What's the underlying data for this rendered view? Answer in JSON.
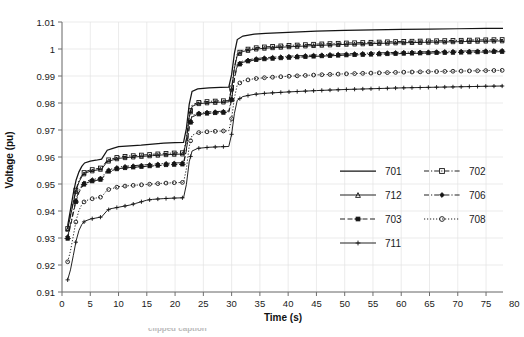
{
  "chart_data": {
    "type": "line",
    "title": "",
    "xlabel": "Time (s)",
    "ylabel": "Voltage (pu)",
    "xlim": [
      0,
      78
    ],
    "ylim": [
      0.91,
      1.01
    ],
    "grid": true,
    "legend_position": "center-right",
    "xticks": [
      0,
      5,
      10,
      15,
      20,
      25,
      30,
      35,
      40,
      45,
      50,
      55,
      60,
      65,
      70,
      75,
      80
    ],
    "yticks": [
      0.91,
      0.92,
      0.93,
      0.94,
      0.95,
      0.96,
      0.97,
      0.98,
      0.99,
      1.0,
      1.01
    ],
    "ytick_labels": [
      "0.91",
      "0.92",
      "0.93",
      "0.94",
      "0.95",
      "0.96",
      "0.97",
      "0.98",
      "0.99",
      "1",
      "1.01"
    ],
    "xtick_labels": [
      "0",
      "5",
      "10",
      "15",
      "20",
      "25",
      "30",
      "35",
      "40",
      "45",
      "50",
      "55",
      "60",
      "65",
      "70",
      "75",
      "80"
    ],
    "series": [
      {
        "name": "701",
        "style": "solid",
        "marker": "none",
        "x": [
          1,
          1.5,
          2,
          2.5,
          3,
          3.5,
          4,
          5,
          6,
          7,
          8,
          9,
          10,
          12,
          14,
          16,
          18,
          20,
          21.5,
          22,
          22.5,
          23,
          24,
          26,
          28,
          29.5,
          30,
          30.5,
          31,
          32,
          34,
          36,
          40,
          45,
          50,
          55,
          60,
          65,
          70,
          75,
          78
        ],
        "y": [
          0.9345,
          0.9405,
          0.9465,
          0.9515,
          0.9545,
          0.9565,
          0.9578,
          0.9585,
          0.9588,
          0.9592,
          0.9625,
          0.9632,
          0.9638,
          0.9641,
          0.9644,
          0.9648,
          0.9651,
          0.9653,
          0.9654,
          0.9705,
          0.9795,
          0.9843,
          0.9852,
          0.9856,
          0.9858,
          0.9859,
          0.9905,
          0.9985,
          1.0035,
          1.0048,
          1.0055,
          1.0058,
          1.0062,
          1.0066,
          1.0069,
          1.0071,
          1.0073,
          1.0074,
          1.0075,
          1.0076,
          1.0076
        ]
      },
      {
        "name": "702",
        "style": "dash-dot",
        "marker": "square",
        "x": [
          1,
          1.5,
          2,
          2.5,
          3,
          3.5,
          4,
          5,
          6,
          7,
          8,
          9,
          10,
          12,
          14,
          16,
          18,
          20,
          21.5,
          22,
          22.5,
          23,
          24,
          26,
          28,
          29.5,
          30,
          30.5,
          31,
          32,
          34,
          36,
          40,
          45,
          50,
          55,
          60,
          65,
          70,
          75,
          78
        ],
        "y": [
          0.9335,
          0.9385,
          0.9435,
          0.9482,
          0.9512,
          0.9532,
          0.9545,
          0.9552,
          0.9556,
          0.956,
          0.9588,
          0.9594,
          0.96,
          0.9604,
          0.9607,
          0.961,
          0.9613,
          0.9615,
          0.9616,
          0.9668,
          0.9752,
          0.9792,
          0.9802,
          0.9806,
          0.9808,
          0.9809,
          0.9856,
          0.9934,
          0.9982,
          0.9996,
          1.0004,
          1.0008,
          1.0013,
          1.0018,
          1.0022,
          1.0025,
          1.0028,
          1.003,
          1.0032,
          1.0034,
          1.0035
        ]
      },
      {
        "name": "712",
        "style": "solid-marker",
        "marker": "triangle",
        "x": [
          1,
          1.5,
          2,
          2.5,
          3,
          3.5,
          4,
          5,
          6,
          7,
          8,
          9,
          10,
          12,
          14,
          16,
          18,
          20,
          21.5,
          22,
          22.5,
          23,
          24,
          26,
          28,
          29.5,
          30,
          30.5,
          31,
          32,
          34,
          36,
          40,
          45,
          50,
          55,
          60,
          65,
          70,
          75,
          78
        ],
        "y": [
          0.9332,
          0.9381,
          0.943,
          0.9477,
          0.9507,
          0.9527,
          0.954,
          0.9547,
          0.9551,
          0.9555,
          0.9583,
          0.9589,
          0.9595,
          0.9599,
          0.9602,
          0.9605,
          0.9608,
          0.961,
          0.9611,
          0.9663,
          0.9747,
          0.9787,
          0.9797,
          0.9801,
          0.9803,
          0.9804,
          0.9851,
          0.9929,
          0.9977,
          0.9991,
          0.9999,
          1.0003,
          1.0008,
          1.0013,
          1.0017,
          1.002,
          1.0023,
          1.0025,
          1.0027,
          1.0029,
          1.003
        ]
      },
      {
        "name": "706",
        "style": "dash-dot",
        "marker": "diamond",
        "x": [
          1,
          1.5,
          2,
          2.5,
          3,
          3.5,
          4,
          5,
          6,
          7,
          8,
          9,
          10,
          12,
          14,
          16,
          18,
          20,
          21.5,
          22,
          22.5,
          23,
          24,
          26,
          28,
          29.5,
          30,
          30.5,
          31,
          32,
          34,
          36,
          40,
          45,
          50,
          55,
          60,
          65,
          70,
          75,
          78
        ],
        "y": [
          0.9305,
          0.935,
          0.9398,
          0.9444,
          0.9474,
          0.9494,
          0.9507,
          0.9515,
          0.9519,
          0.9523,
          0.9551,
          0.9557,
          0.9563,
          0.9567,
          0.957,
          0.9573,
          0.9576,
          0.9578,
          0.9579,
          0.9629,
          0.9713,
          0.9753,
          0.9763,
          0.9767,
          0.9769,
          0.977,
          0.9816,
          0.9894,
          0.9942,
          0.9956,
          0.9964,
          0.9968,
          0.9973,
          0.9978,
          0.9982,
          0.9985,
          0.9988,
          0.999,
          0.9992,
          0.9994,
          0.9995
        ]
      },
      {
        "name": "703",
        "style": "dashed",
        "marker": "cross-bar",
        "x": [
          1,
          1.5,
          2,
          2.5,
          3,
          3.5,
          4,
          5,
          6,
          7,
          8,
          9,
          10,
          12,
          14,
          16,
          18,
          20,
          21.5,
          22,
          22.5,
          23,
          24,
          26,
          28,
          29.5,
          30,
          30.5,
          31,
          32,
          34,
          36,
          40,
          45,
          50,
          55,
          60,
          65,
          70,
          75,
          78
        ],
        "y": [
          0.9298,
          0.9344,
          0.9392,
          0.9438,
          0.9468,
          0.9488,
          0.9501,
          0.9509,
          0.9513,
          0.9517,
          0.9545,
          0.9551,
          0.9557,
          0.9561,
          0.9564,
          0.9567,
          0.957,
          0.9572,
          0.9573,
          0.9624,
          0.9708,
          0.9748,
          0.9758,
          0.9762,
          0.9764,
          0.9765,
          0.9811,
          0.9889,
          0.9937,
          0.9951,
          0.9959,
          0.9963,
          0.9968,
          0.9973,
          0.9977,
          0.998,
          0.9983,
          0.9985,
          0.9987,
          0.9989,
          0.999
        ]
      },
      {
        "name": "708",
        "style": "dotted",
        "marker": "circle",
        "x": [
          1,
          1.5,
          2,
          2.5,
          3,
          3.5,
          4,
          5,
          6,
          7,
          8,
          9,
          10,
          12,
          14,
          16,
          18,
          20,
          21.5,
          22,
          22.5,
          23,
          24,
          26,
          28,
          29.5,
          30,
          30.5,
          31,
          32,
          34,
          36,
          40,
          45,
          50,
          55,
          60,
          65,
          70,
          75,
          78
        ],
        "y": [
          0.9212,
          0.9252,
          0.9308,
          0.9365,
          0.9402,
          0.9424,
          0.9436,
          0.9444,
          0.9448,
          0.9452,
          0.9478,
          0.9484,
          0.949,
          0.9494,
          0.9497,
          0.95,
          0.9503,
          0.9505,
          0.9506,
          0.9556,
          0.964,
          0.968,
          0.969,
          0.9694,
          0.9696,
          0.9697,
          0.9742,
          0.982,
          0.9868,
          0.9882,
          0.989,
          0.9894,
          0.9899,
          0.9904,
          0.9908,
          0.9911,
          0.9914,
          0.9916,
          0.9918,
          0.992,
          0.9921
        ]
      },
      {
        "name": "711",
        "style": "solid-marker",
        "marker": "plus",
        "x": [
          1,
          1.5,
          2,
          2.5,
          3,
          3.5,
          4,
          5,
          6,
          7,
          8,
          8.5,
          9,
          10,
          12,
          13,
          14,
          15,
          16,
          18,
          20,
          21.5,
          22,
          22.5,
          23,
          24,
          26,
          28,
          29.5,
          30,
          30.5,
          31,
          32,
          34,
          36,
          40,
          45,
          50,
          55,
          60,
          65,
          70,
          75,
          78
        ],
        "y": [
          0.9145,
          0.9182,
          0.9235,
          0.929,
          0.9328,
          0.935,
          0.9362,
          0.937,
          0.9374,
          0.9378,
          0.9402,
          0.9408,
          0.941,
          0.9414,
          0.9422,
          0.9428,
          0.9434,
          0.944,
          0.9443,
          0.9446,
          0.9448,
          0.9449,
          0.9498,
          0.9582,
          0.9622,
          0.9632,
          0.9636,
          0.9638,
          0.9639,
          0.9684,
          0.9762,
          0.981,
          0.9824,
          0.9832,
          0.9836,
          0.9841,
          0.9846,
          0.985,
          0.9853,
          0.9856,
          0.9858,
          0.986,
          0.9862,
          0.9863
        ]
      }
    ]
  },
  "legend": {
    "entries": [
      {
        "label": "701",
        "marker": "none",
        "style": "solid"
      },
      {
        "label": "702",
        "marker": "square",
        "style": "dash-dot"
      },
      {
        "label": "712",
        "marker": "triangle",
        "style": "solid-marker"
      },
      {
        "label": "706",
        "marker": "diamond",
        "style": "dash-dot"
      },
      {
        "label": "703",
        "marker": "cross-bar",
        "style": "dashed"
      },
      {
        "label": "708",
        "marker": "circle",
        "style": "dotted"
      },
      {
        "label": "711",
        "marker": "plus",
        "style": "solid-marker"
      }
    ]
  },
  "caption": {
    "text": "clipped caption"
  }
}
